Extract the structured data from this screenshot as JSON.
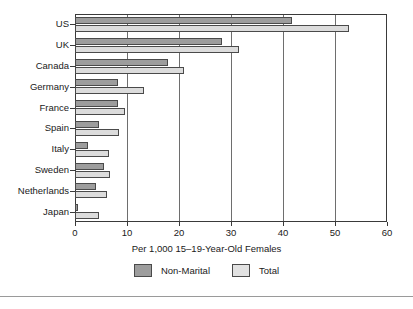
{
  "chart_data": {
    "type": "bar",
    "orientation": "horizontal",
    "title": "",
    "xlabel": "Per 1,000 15–19-Year-Old Females",
    "ylabel": "",
    "xlim": [
      0,
      60
    ],
    "xticks": [
      0,
      10,
      20,
      30,
      40,
      50,
      60
    ],
    "xtick_labels": [
      "0",
      "10",
      "20",
      "30",
      "40",
      "50",
      "60"
    ],
    "grid": "vertical",
    "legend_position": "below-axis-center",
    "categories": [
      "US",
      "UK",
      "Canada",
      "Germany",
      "France",
      "Spain",
      "Italy",
      "Sweden",
      "Netherlands",
      "Japan"
    ],
    "series": [
      {
        "name": "Non-Marital",
        "color": "#9d9d9d",
        "values": [
          41.8,
          28.3,
          17.8,
          8.2,
          8.3,
          4.6,
          2.5,
          5.5,
          4.0,
          0.5
        ]
      },
      {
        "name": "Total",
        "color": "#dcdcdc",
        "values": [
          52.6,
          31.5,
          20.9,
          13.3,
          9.7,
          8.4,
          6.5,
          6.8,
          6.2,
          4.6
        ]
      }
    ]
  },
  "axis": {
    "x_title": "Per 1,000 15–19-Year-Old Females"
  },
  "legend": {
    "items": [
      {
        "label": "Non-Marital",
        "color": "#9d9d9d"
      },
      {
        "label": "Total",
        "color": "#e2e2e2"
      }
    ]
  }
}
